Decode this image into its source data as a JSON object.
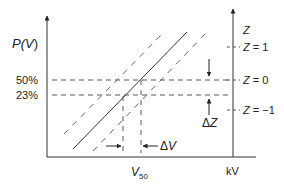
{
  "diagram": {
    "y_axis_label": "P(V)",
    "y_axis_label_prefix": "P(",
    "y_axis_label_var": "V",
    "y_axis_label_suffix": ")",
    "x_axis_label_var": "V",
    "x_axis_label_sub": "50",
    "x_axis_unit": "kV",
    "right_axis_label": "Z",
    "levels": [
      {
        "label": "50%",
        "z_label": "Z = 0"
      },
      {
        "label": "23%",
        "z_label": ""
      }
    ],
    "z_ticks": [
      {
        "label_var": "Z",
        "label_rest": " = 1"
      },
      {
        "label_var": "Z",
        "label_rest": " = 0"
      },
      {
        "label_var": "Z",
        "label_rest": " = −1"
      }
    ],
    "delta_z": {
      "symbol": "Δ",
      "var": "Z"
    },
    "delta_v": {
      "symbol": "Δ",
      "var": "V"
    },
    "colors": {
      "ink": "#222222",
      "background": "#ffffff"
    }
  }
}
